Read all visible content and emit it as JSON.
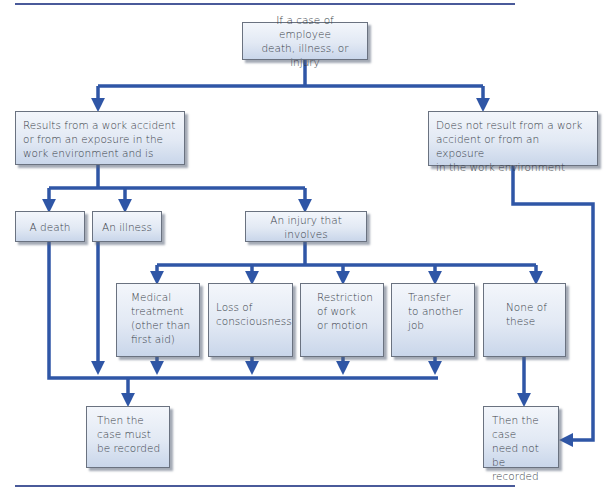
{
  "diagram": {
    "type": "flowchart",
    "colors": {
      "connector": "#2f56a6",
      "box_border": "#6a7280",
      "box_fill_top": "#f3f6fb",
      "box_fill_bottom": "#c9d6ea",
      "rule": "#4a5a9a"
    },
    "nodes": {
      "start": "If a case of employee\ndeath, illness, or injury",
      "work_related": "Results from a work accident\nor from an exposure in the\nwork environment and is",
      "not_work_related": "Does not result from a work\naccident or from an exposure\nin the work environment",
      "death": "A death",
      "illness": "An illness",
      "injury": "An injury that involves",
      "medical": "Medical\ntreatment\n(other than\nfirst aid)",
      "consciousness": "Loss of\nconsciousness",
      "restriction": "Restriction\nof work\nor motion",
      "transfer": "Transfer\nto another\njob",
      "none": "None of\nthese",
      "must_record": "Then the\ncase must\nbe recorded",
      "need_not_record": "Then the case\nneed not be\nrecorded"
    }
  }
}
